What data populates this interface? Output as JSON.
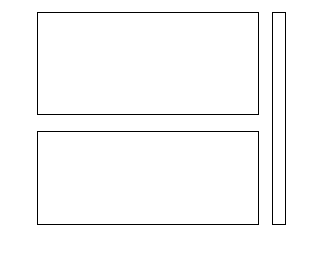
{
  "figure": {
    "background": "#ffffff",
    "width": 315,
    "height": 256
  },
  "chart_data": [
    {
      "type": "heatmap",
      "name": "top-panel",
      "title": "",
      "xlabel": "",
      "ylabel": "",
      "orientation": "horizontal-gradient",
      "xlim": [
        0,
        100
      ],
      "ylim": [
        0,
        100
      ],
      "xticks": [
        0,
        20,
        40,
        60,
        80,
        100
      ],
      "yticks": [
        0,
        20,
        40,
        60,
        80,
        100
      ],
      "xticklabels": [
        "0",
        "20",
        "40",
        "60",
        "80",
        "100"
      ],
      "yticklabels": [
        "0",
        "20",
        "40",
        "60",
        "80",
        "100"
      ],
      "xticklabels_visible": false,
      "grid": false,
      "n_bands": 7,
      "band_edges": [
        0,
        14.3,
        28.6,
        42.9,
        57.1,
        71.4,
        85.7,
        100
      ],
      "band_values": [
        7.5,
        22.5,
        37.5,
        52.5,
        67.5,
        82.5,
        97.5
      ],
      "band_colors": [
        "#3a3a3a",
        "#525252",
        "#4a4a4a",
        "#7a7a7a",
        "#c2c2c2",
        "#b4b4b4",
        "#dcdcdc"
      ],
      "description": "Discrete grayscale bands varying along the x axis, light toward the right"
    },
    {
      "type": "heatmap",
      "name": "bottom-panel",
      "title": "",
      "xlabel": "",
      "ylabel": "",
      "orientation": "vertical-gradient",
      "xlim": [
        0,
        100
      ],
      "ylim": [
        0,
        100
      ],
      "xticks": [
        0,
        20,
        40,
        60,
        80,
        100
      ],
      "yticks": [
        0,
        20,
        40,
        60,
        80,
        100
      ],
      "xticklabels": [
        "0",
        "20",
        "40",
        "60",
        "80",
        "100"
      ],
      "yticklabels": [
        "0",
        "20",
        "40",
        "60",
        "80",
        "100"
      ],
      "xticklabels_visible": true,
      "grid": false,
      "n_bands": 7,
      "band_edges": [
        0,
        14.3,
        28.6,
        42.9,
        57.1,
        71.4,
        85.7,
        100
      ],
      "band_values": [
        7.5,
        22.5,
        37.5,
        52.5,
        67.5,
        82.5,
        97.5
      ],
      "band_colors_top_to_bottom": [
        "#d8d8d8",
        "#c8c8c8",
        "#bcbcbc",
        "#a0a0a0",
        "#6e6e6e",
        "#5a5a5a",
        "#464646"
      ],
      "description": "Discrete grayscale bands varying along the y axis, light toward the top"
    },
    {
      "type": "colorbar",
      "name": "shared-colorbar",
      "orientation": "vertical",
      "vmin": 0,
      "vmax": 105,
      "ticks": [
        0,
        15,
        30,
        45,
        60,
        75,
        90,
        105
      ],
      "ticklabels": [
        "0",
        "15",
        "30",
        "45",
        "60",
        "75",
        "90",
        "105"
      ],
      "n_bands": 7,
      "cmap": "gray",
      "band_colors_bottom_to_top": [
        "#464646",
        "#5a5a5a",
        "#6e6e6e",
        "#8c8c8c",
        "#a8a8a8",
        "#c4c4c4",
        "#dcdcdc"
      ]
    }
  ],
  "top_panel": {
    "yticklabels": [
      "0",
      "20",
      "40",
      "60",
      "80",
      "100"
    ]
  },
  "bottom_panel": {
    "yticklabels": [
      "0",
      "20",
      "40",
      "60",
      "80",
      "100"
    ],
    "xticklabels": [
      "0",
      "20",
      "40",
      "60",
      "80",
      "100"
    ]
  },
  "colorbar": {
    "ticklabels": [
      "0",
      "15",
      "30",
      "45",
      "60",
      "75",
      "90",
      "105"
    ]
  }
}
